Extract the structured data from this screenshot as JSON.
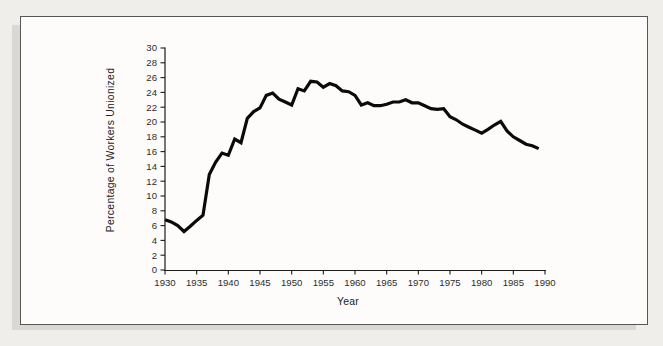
{
  "figure": {
    "page_background": "#f0eeeb",
    "frame_fill": "#fdfcfa",
    "frame_border_color": "#565656",
    "shadow_color": "#dbd8d3"
  },
  "chart_data": {
    "type": "line",
    "title": "",
    "xlabel": "Year",
    "ylabel": "Percentage of Workers Unionized",
    "xlim": [
      1930,
      1990
    ],
    "ylim": [
      0,
      30
    ],
    "x_ticks": [
      1930,
      1935,
      1940,
      1945,
      1950,
      1955,
      1960,
      1965,
      1970,
      1975,
      1980,
      1985,
      1990
    ],
    "y_ticks": [
      0,
      2,
      4,
      6,
      8,
      10,
      12,
      14,
      16,
      18,
      20,
      22,
      24,
      26,
      28,
      30
    ],
    "grid": false,
    "legend": "none",
    "line_color": "#0a0a0a",
    "line_width": 3.2,
    "axis_color": "#1c1c1c",
    "series": [
      {
        "name": "Percentage of workers unionized",
        "x": [
          1930,
          1931,
          1932,
          1933,
          1934,
          1935,
          1936,
          1937,
          1938,
          1939,
          1940,
          1941,
          1942,
          1943,
          1944,
          1945,
          1946,
          1947,
          1948,
          1949,
          1950,
          1951,
          1952,
          1953,
          1954,
          1955,
          1956,
          1957,
          1958,
          1959,
          1960,
          1961,
          1962,
          1963,
          1964,
          1965,
          1966,
          1967,
          1968,
          1969,
          1970,
          1971,
          1972,
          1973,
          1974,
          1975,
          1976,
          1977,
          1978,
          1979,
          1980,
          1981,
          1982,
          1983,
          1984,
          1985,
          1986,
          1987,
          1988,
          1989
        ],
        "y": [
          6.8,
          6.5,
          6.0,
          5.2,
          5.9,
          6.7,
          7.4,
          12.9,
          14.6,
          15.8,
          15.5,
          17.7,
          17.2,
          20.5,
          21.4,
          21.9,
          23.6,
          23.9,
          23.1,
          22.7,
          22.3,
          24.5,
          24.2,
          25.5,
          25.4,
          24.7,
          25.2,
          24.9,
          24.2,
          24.1,
          23.6,
          22.3,
          22.6,
          22.2,
          22.2,
          22.4,
          22.7,
          22.7,
          23.0,
          22.6,
          22.6,
          22.2,
          21.8,
          21.7,
          21.8,
          20.7,
          20.3,
          19.7,
          19.3,
          18.9,
          18.5,
          19.0,
          19.6,
          20.1,
          18.8,
          18.0,
          17.5,
          17.0,
          16.8,
          16.4
        ]
      }
    ]
  }
}
